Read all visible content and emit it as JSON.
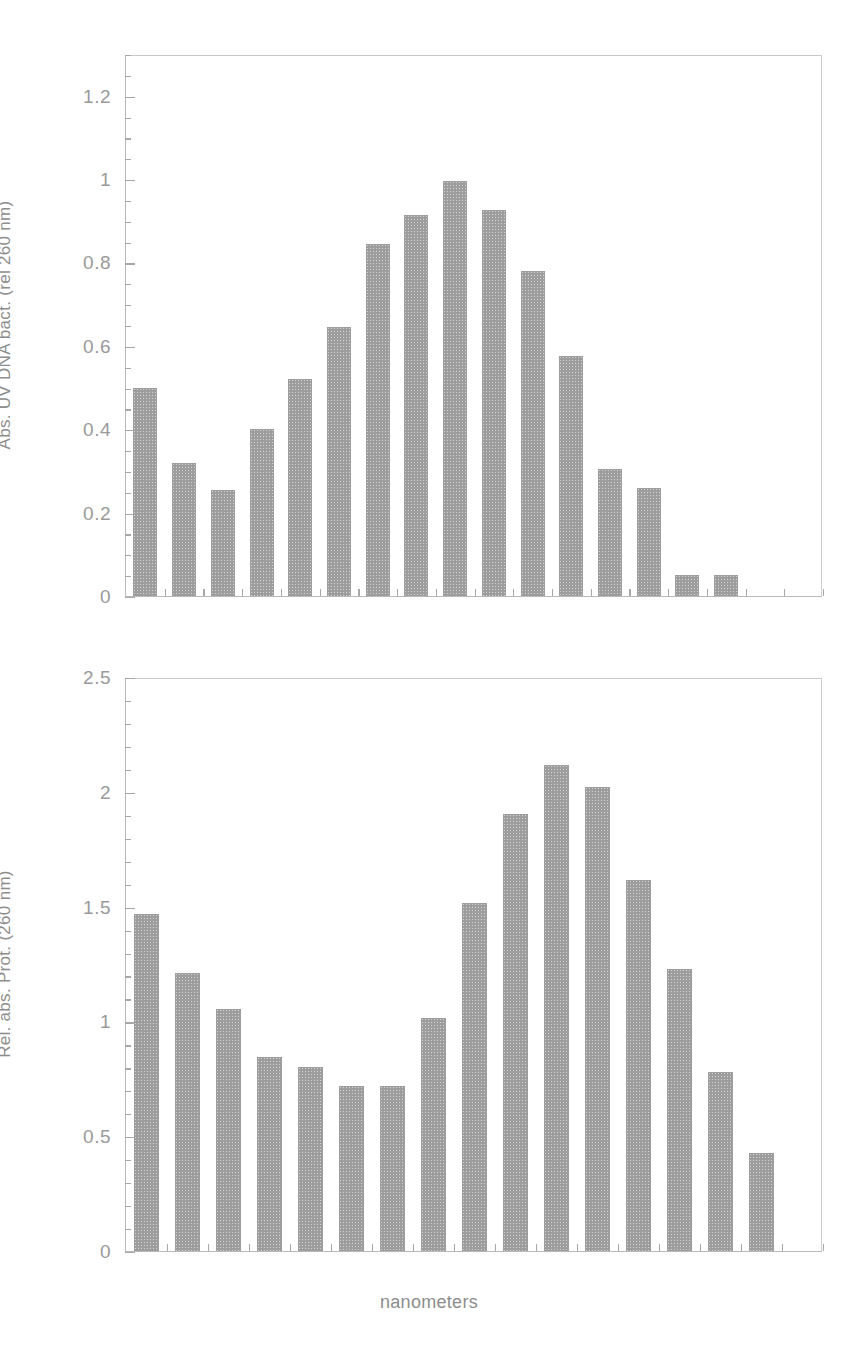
{
  "figure": {
    "xlabel": "nanometers",
    "bar_color": "#9d9d9d",
    "axis_color": "#a8a8a8",
    "text_color": "#8d8d8d"
  },
  "chart_data": [
    {
      "type": "bar",
      "panel": "top",
      "title": "",
      "xlabel": "",
      "ylabel": "Abs. UV DNA bact. (rel 260 nm)",
      "ylim": [
        0,
        1.3
      ],
      "ytick_labels": [
        "0",
        "0.2",
        "0.4",
        "0.6",
        "0.8",
        "1",
        "1.2"
      ],
      "ytick_values": [
        0,
        0.2,
        0.4,
        0.6,
        0.8,
        1,
        1.2
      ],
      "minor_tick_step": 0.05,
      "grid": false,
      "legend": "none",
      "categories": [
        "1",
        "2",
        "3",
        "4",
        "5",
        "6",
        "7",
        "8",
        "9",
        "10",
        "11",
        "12",
        "13",
        "14",
        "15",
        "16",
        "17",
        "18"
      ],
      "values": [
        0.5,
        0.32,
        0.255,
        0.4,
        0.52,
        0.645,
        0.845,
        0.915,
        0.995,
        0.925,
        0.78,
        0.575,
        0.305,
        0.26,
        0.05,
        0.05,
        0,
        0
      ]
    },
    {
      "type": "bar",
      "panel": "bottom",
      "title": "",
      "xlabel": "nanometers",
      "ylabel": "Rel. abs. Prot. (260 nm)",
      "ylim": [
        0,
        2.5
      ],
      "ytick_labels": [
        "0",
        "0.5",
        "1",
        "1.5",
        "2",
        "2.5"
      ],
      "ytick_values": [
        0,
        0.5,
        1,
        1.5,
        2,
        2.5
      ],
      "minor_tick_step": 0.1,
      "grid": false,
      "legend": "none",
      "categories": [
        "1",
        "2",
        "3",
        "4",
        "5",
        "6",
        "7",
        "8",
        "9",
        "10",
        "11",
        "12",
        "13",
        "14",
        "15",
        "16",
        "17"
      ],
      "values": [
        1.47,
        1.21,
        1.055,
        0.845,
        0.8,
        0.72,
        0.72,
        1.015,
        1.515,
        1.905,
        2.115,
        2.02,
        1.615,
        1.23,
        0.78,
        0.425,
        0
      ]
    }
  ]
}
